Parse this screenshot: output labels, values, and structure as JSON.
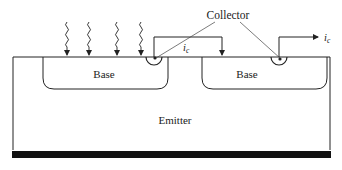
{
  "diagram": {
    "labels": {
      "collector": "Collector",
      "base_left": "Base",
      "base_right": "Base",
      "emitter": "Emitter",
      "current_inner": "i",
      "current_inner_sub": "c",
      "current_outer": "i",
      "current_outer_sub": "c"
    },
    "colors": {
      "line": "#222222",
      "substrate_bar": "#111111",
      "background": "#ffffff"
    }
  }
}
